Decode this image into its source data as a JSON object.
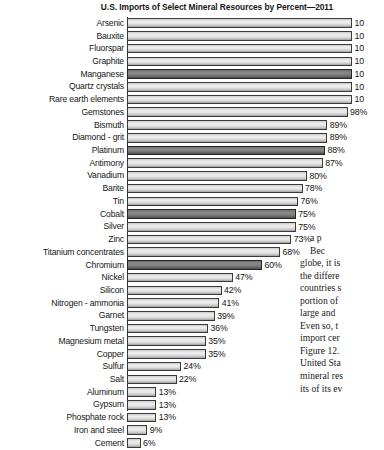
{
  "chart_title": "U.S. Imports of Select Mineral Resources by Percent—2011",
  "colors": {
    "bar_fill_light": "#e4e4e4",
    "bar_fill_dark": "#7d7d7d",
    "bar_border": "#3a3a3a",
    "text": "#161616",
    "background": "#ffffff"
  },
  "chart_data": {
    "type": "bar",
    "orientation": "horizontal",
    "title": "U.S. Imports of Select Mineral Resources by Percent—2011",
    "xlabel": "",
    "ylabel": "",
    "xlim": [
      0,
      100
    ],
    "grid": false,
    "legend": null,
    "categories": [
      "Arsenic",
      "Bauxite",
      "Fluorspar",
      "Graphite",
      "Manganese",
      "Quartz crystals",
      "Rare earth elements",
      "Gemstones",
      "Bismuth",
      "Diamond - grit",
      "Platinum",
      "Antimony",
      "Vanadium",
      "Barite",
      "Tin",
      "Cobalt",
      "Silver",
      "Zinc",
      "Titanium concentrates",
      "Chromium",
      "Nickel",
      "Silicon",
      "Nitrogen - ammonia",
      "Garnet",
      "Tungsten",
      "Magnesium metal",
      "Copper",
      "Sulfur",
      "Salt",
      "Aluminum",
      "Gypsum",
      "Phosphate rock",
      "Iron and steel",
      "Cement"
    ],
    "values": [
      100,
      100,
      100,
      100,
      100,
      100,
      100,
      98,
      89,
      89,
      88,
      87,
      80,
      78,
      76,
      75,
      75,
      73,
      68,
      60,
      47,
      42,
      41,
      39,
      36,
      35,
      35,
      24,
      22,
      13,
      13,
      13,
      9,
      6
    ],
    "value_labels": [
      "10",
      "10",
      "10",
      "10",
      "10",
      "10",
      "10",
      "98%",
      "89%",
      "89%",
      "88%",
      "87%",
      "80%",
      "78%",
      "76%",
      "75%",
      "75%",
      "73%",
      "68%",
      "60%",
      "47%",
      "42%",
      "41%",
      "39%",
      "36%",
      "35%",
      "35%",
      "24%",
      "22%",
      "13%",
      "13%",
      "13%",
      "9%",
      "6%"
    ],
    "highlighted": [
      false,
      false,
      false,
      false,
      true,
      false,
      false,
      false,
      false,
      false,
      true,
      false,
      false,
      false,
      false,
      true,
      false,
      false,
      false,
      true,
      false,
      false,
      false,
      false,
      false,
      false,
      false,
      false,
      false,
      false,
      false,
      false,
      false,
      false
    ]
  },
  "body_text": {
    "lines": [
      "a p",
      "Bec",
      "globe, it is",
      "the differe",
      "countries s",
      "portion of",
      "large and",
      "Even so, t",
      "import cer",
      "Figure 12.",
      "United Sta",
      "mineral res",
      "its of its ev"
    ]
  }
}
